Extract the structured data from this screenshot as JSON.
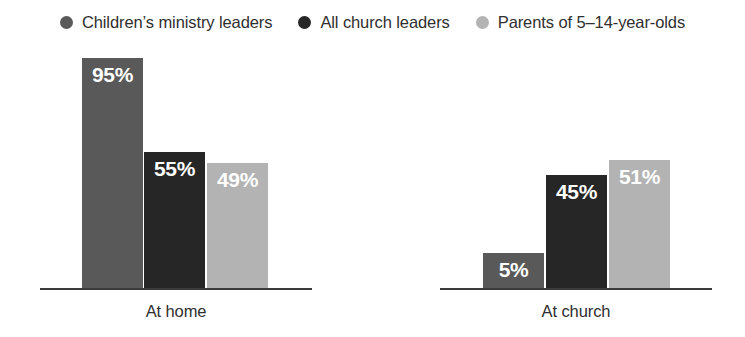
{
  "legend": {
    "items": [
      {
        "label": "Children’s ministry leaders",
        "color": "#595959",
        "marker": "circle-marker"
      },
      {
        "label": "All church leaders",
        "color": "#262626",
        "marker": "circle-marker"
      },
      {
        "label": "Parents of 5–14-year-olds",
        "color": "#b3b3b3",
        "marker": "circle-marker"
      }
    ]
  },
  "chart_data": {
    "type": "bar",
    "title": "",
    "subtitle": "",
    "xlabel": "",
    "ylabel": "",
    "ylim": [
      0,
      100
    ],
    "grid": false,
    "legend_position": "top-center",
    "value_suffix": "%",
    "categories": [
      "At home",
      "At church"
    ],
    "series": [
      {
        "name": "Children’s ministry leaders",
        "color": "#595959",
        "values": [
          95,
          5
        ],
        "labels": [
          "95%",
          "5%"
        ]
      },
      {
        "name": "All church leaders",
        "color": "#262626",
        "values": [
          55,
          45
        ],
        "labels": [
          "55%",
          "45%"
        ]
      },
      {
        "name": "Parents of 5–14-year-olds",
        "color": "#b3b3b3",
        "values": [
          49,
          51
        ],
        "labels": [
          "49%",
          "51%"
        ]
      }
    ],
    "axis_color": "#3c3c3c"
  },
  "groups": [
    {
      "name": "At home",
      "label": "At home",
      "axis": {
        "left": 40,
        "width": 272
      },
      "label_box": {
        "left": 40,
        "width": 272
      },
      "bars": [
        {
          "name": "bar-at-home-childrens-ministry-leaders",
          "left": 82,
          "height": 230,
          "color": "#595959",
          "label": "95%"
        },
        {
          "name": "bar-at-home-all-church-leaders",
          "left": 144,
          "height": 136,
          "color": "#262626",
          "label": "55%"
        },
        {
          "name": "bar-at-home-parents",
          "left": 207,
          "height": 125,
          "color": "#b3b3b3",
          "label": "49%"
        }
      ]
    },
    {
      "name": "At church",
      "label": "At church",
      "axis": {
        "left": 440,
        "width": 272
      },
      "label_box": {
        "left": 440,
        "width": 272
      },
      "bars": [
        {
          "name": "bar-at-church-childrens-ministry-leaders",
          "left": 483,
          "height": 35,
          "color": "#595959",
          "label": "5%"
        },
        {
          "name": "bar-at-church-all-church-leaders",
          "left": 546,
          "height": 113,
          "color": "#262626",
          "label": "45%"
        },
        {
          "name": "bar-at-church-parents",
          "left": 609,
          "height": 128,
          "color": "#b3b3b3",
          "label": "51%"
        }
      ]
    }
  ]
}
